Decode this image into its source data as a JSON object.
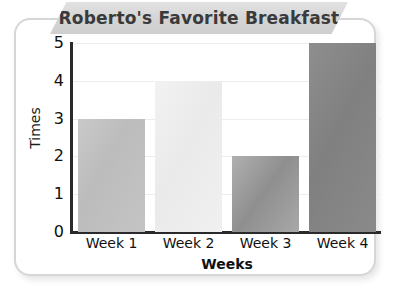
{
  "chart_data": {
    "type": "bar",
    "title": "Roberto's Favorite Breakfast",
    "xlabel": "Weeks",
    "ylabel": "Times",
    "categories": [
      "Week 1",
      "Week 2",
      "Week 3",
      "Week 4"
    ],
    "values": [
      3,
      4,
      2,
      5
    ],
    "ylim": [
      0,
      5
    ],
    "yticks": [
      "0",
      "1",
      "2",
      "3",
      "4",
      "5"
    ],
    "grid": true,
    "legend": "none",
    "bar_colors": [
      "#bdbdbd",
      "#efefef",
      "#9a9a9a",
      "#888888"
    ]
  },
  "card": {
    "border_color": "#d6d6d6",
    "background": "#ffffff"
  },
  "banner": {
    "background": "#d7d7d7",
    "text_color": "#3a3a3a"
  },
  "axis": {
    "line_color": "#2a2a2a",
    "gridline_color": "#ededed",
    "tick_text_color": "#111111"
  }
}
